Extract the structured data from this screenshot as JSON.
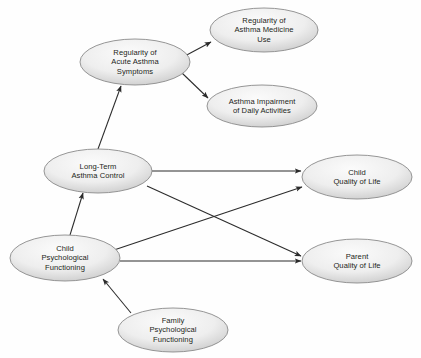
{
  "diagram": {
    "type": "path-diagram",
    "background_color": "#fefefe",
    "node_fill_center": "#f4f4f4",
    "node_fill_edge": "#c9c9c9",
    "node_stroke": "#8a8a8a",
    "edge_color": "#2b2b2b",
    "text_color": "#231f20",
    "nodes": [
      {
        "id": "acute_symptoms",
        "label": "Regularity of\nAcute Asthma\nSymptoms",
        "cx": 135,
        "cy": 62,
        "rx": 55,
        "ry": 23
      },
      {
        "id": "medicine_use",
        "label": "Regularity of\nAsthma Medicine\nUse",
        "cx": 264,
        "cy": 30,
        "rx": 54,
        "ry": 22
      },
      {
        "id": "daily_impairment",
        "label": "Asthma Impairment\nof Daily Activities",
        "cx": 262,
        "cy": 106,
        "rx": 55,
        "ry": 21
      },
      {
        "id": "asthma_control",
        "label": "Long-Term\nAsthma Control",
        "cx": 98,
        "cy": 171,
        "rx": 54,
        "ry": 22
      },
      {
        "id": "child_psych",
        "label": "Child\nPsychological\nFunctioning",
        "cx": 65,
        "cy": 258,
        "rx": 55,
        "ry": 23
      },
      {
        "id": "family_psych",
        "label": "Family\nPsychological\nFunctioning",
        "cx": 173,
        "cy": 330,
        "rx": 55,
        "ry": 22
      },
      {
        "id": "child_qol",
        "label": "Child\nQuality of Life",
        "cx": 357,
        "cy": 177,
        "rx": 55,
        "ry": 22
      },
      {
        "id": "parent_qol",
        "label": "Parent\nQuality of Life",
        "cx": 357,
        "cy": 261,
        "rx": 55,
        "ry": 22
      }
    ],
    "edges": [
      {
        "id": "acute-to-medicine",
        "from": "acute_symptoms",
        "to": "medicine_use",
        "x1": 183,
        "y1": 57,
        "x2": 211,
        "y2": 42
      },
      {
        "id": "acute-to-impairment",
        "from": "acute_symptoms",
        "to": "daily_impairment",
        "x1": 182,
        "y1": 73,
        "x2": 208,
        "y2": 98
      },
      {
        "id": "control-to-acute",
        "from": "asthma_control",
        "to": "acute_symptoms",
        "x1": 98,
        "y1": 149,
        "x2": 121,
        "y2": 86
      },
      {
        "id": "childpsych-to-control",
        "from": "child_psych",
        "to": "asthma_control",
        "x1": 70,
        "y1": 235,
        "x2": 83,
        "y2": 193
      },
      {
        "id": "familypsych-to-childpsych",
        "from": "family_psych",
        "to": "child_psych",
        "x1": 131,
        "y1": 313,
        "x2": 103,
        "y2": 279
      },
      {
        "id": "control-to-childqol",
        "from": "asthma_control",
        "to": "child_qol",
        "x1": 152,
        "y1": 171,
        "x2": 301,
        "y2": 171
      },
      {
        "id": "control-to-parentqol",
        "from": "asthma_control",
        "to": "parent_qol",
        "x1": 147,
        "y1": 186,
        "x2": 301,
        "y2": 256
      },
      {
        "id": "childpsych-to-childqol",
        "from": "child_psych",
        "to": "child_qol",
        "x1": 114,
        "y1": 250,
        "x2": 302,
        "y2": 187
      },
      {
        "id": "childpsych-to-parentqol",
        "from": "child_psych",
        "to": "parent_qol",
        "x1": 120,
        "y1": 261,
        "x2": 301,
        "y2": 261
      }
    ]
  }
}
